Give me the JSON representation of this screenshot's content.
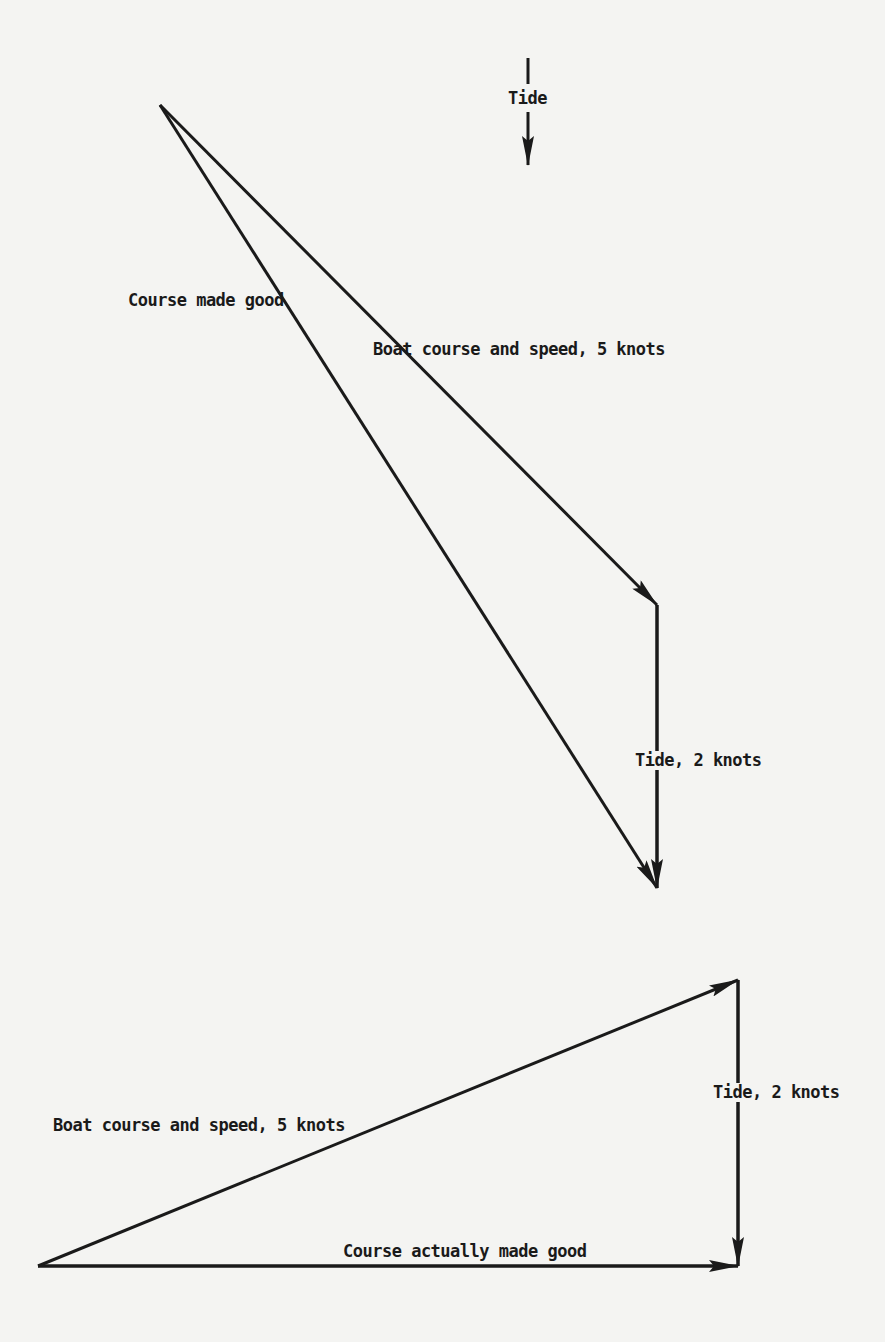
{
  "diagram": {
    "colors": {
      "background": "#f4f4f2",
      "ink": "#1a1a1a"
    },
    "legend": {
      "label": "Tide",
      "direction": "down"
    },
    "upper_triangle": {
      "labels": {
        "course_made_good": "Course made good",
        "boat_course": "Boat course and speed, 5 knots",
        "tide": "Tide, 2 knots"
      },
      "points": {
        "start": [
          160,
          105
        ],
        "boat_end": [
          657,
          605
        ],
        "tide_end": [
          657,
          888
        ]
      }
    },
    "lower_triangle": {
      "labels": {
        "boat_course": "Boat course and speed, 5 knots",
        "tide": "Tide, 2 knots",
        "course_actually_made_good": "Course actually made good"
      },
      "points": {
        "start": [
          38,
          1266
        ],
        "boat_end": [
          738,
          980
        ],
        "tide_end": [
          738,
          1266
        ]
      }
    }
  }
}
